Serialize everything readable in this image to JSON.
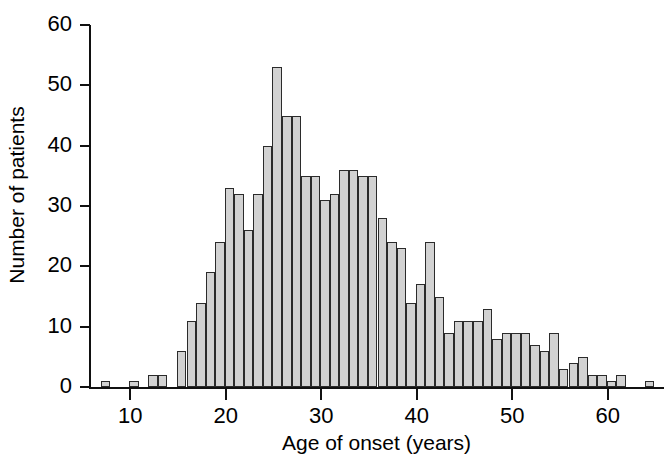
{
  "chart_data": {
    "type": "bar",
    "title": "",
    "subtitle": "",
    "xlabel": "Age of onset (years)",
    "ylabel": "Number of patients",
    "grid": false,
    "legend": null,
    "xlim": [
      6,
      65
    ],
    "ylim": [
      0,
      60
    ],
    "xticks": [
      10,
      20,
      30,
      40,
      50,
      60
    ],
    "yticks": [
      0,
      10,
      20,
      30,
      40,
      50,
      60
    ],
    "bin_width": 1,
    "x_unit": "years",
    "categories": [
      7,
      10,
      12,
      13,
      15,
      16,
      17,
      18,
      19,
      20,
      21,
      22,
      23,
      24,
      25,
      26,
      27,
      28,
      29,
      30,
      31,
      32,
      33,
      34,
      35,
      36,
      37,
      38,
      39,
      40,
      41,
      42,
      43,
      44,
      45,
      46,
      47,
      48,
      49,
      50,
      51,
      52,
      53,
      54,
      55,
      56,
      57,
      58,
      59,
      60,
      61,
      64
    ],
    "values": [
      1,
      1,
      2,
      2,
      6,
      11,
      14,
      19,
      24,
      33,
      32,
      26,
      32,
      40,
      53,
      45,
      45,
      35,
      35,
      31,
      32,
      36,
      36,
      35,
      35,
      28,
      24,
      23,
      14,
      17,
      24,
      15,
      9,
      11,
      11,
      11,
      13,
      8,
      9,
      9,
      9,
      7,
      6,
      9,
      3,
      4,
      5,
      2,
      2,
      1,
      2,
      1
    ]
  },
  "axes": {
    "y_tick_labels": [
      "60",
      "50",
      "40",
      "30",
      "20",
      "10",
      "0"
    ],
    "x_tick_labels": [
      "10",
      "20",
      "30",
      "40",
      "50",
      "60"
    ],
    "y_axis_title": "Number of patients",
    "x_axis_title": "Age of onset (years)"
  },
  "style": {
    "bar_fill": "#d2d2d2",
    "bar_stroke": "#2b2b2b",
    "axis_color": "#111111",
    "background": "#ffffff"
  }
}
